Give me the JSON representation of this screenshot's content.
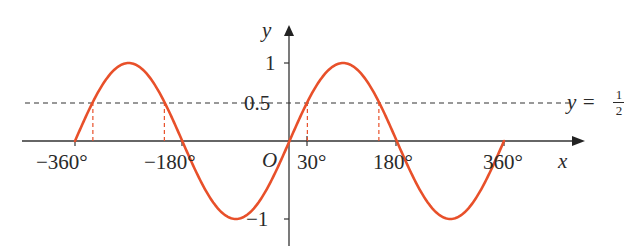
{
  "chart_data": {
    "type": "line",
    "title": "",
    "xlabel": "x",
    "ylabel": "y",
    "xlim": [
      -360,
      360
    ],
    "ylim": [
      -1,
      1
    ],
    "grid": false,
    "series": [
      {
        "name": "y = sin x",
        "function": "sin(x)",
        "color": "#e8502a",
        "x": [
          -360,
          -330,
          -300,
          -270,
          -240,
          -210,
          -180,
          -150,
          -120,
          -90,
          -60,
          -30,
          0,
          30,
          60,
          90,
          120,
          150,
          180,
          210,
          240,
          270,
          300,
          330,
          360
        ],
        "values": [
          0,
          0.5,
          0.866,
          1,
          0.866,
          0.5,
          0,
          -0.5,
          -0.866,
          -1,
          -0.866,
          -0.5,
          0,
          0.5,
          0.866,
          1,
          0.866,
          0.5,
          0,
          -0.5,
          -0.866,
          -1,
          -0.866,
          -0.5,
          0
        ]
      },
      {
        "name": "y = 1/2",
        "style": "dashed",
        "color": "#333333",
        "values_constant": 0.5
      }
    ],
    "annotations": {
      "intersections_x": [
        -330,
        -210,
        30,
        150
      ],
      "drop_lines_color": "#e8502a"
    },
    "x_tick_labels": [
      "−360°",
      "−180°",
      "30°",
      "180°",
      "360°"
    ],
    "y_tick_labels": [
      "1",
      "0.5",
      "−1"
    ],
    "origin_label": "O",
    "line_label": "y = 1/2"
  },
  "labels": {
    "y_axis": "y",
    "x_axis": "x",
    "origin": "O",
    "y_tick_1": "1",
    "y_tick_half": "0.5",
    "y_tick_neg1": "−1",
    "x_tick_neg360": "−360°",
    "x_tick_neg180": "−180°",
    "x_tick_30": "30°",
    "x_tick_180": "180°",
    "x_tick_360": "360°",
    "line_eq_lhs": "y =",
    "line_eq_num": "1",
    "line_eq_den": "2"
  }
}
